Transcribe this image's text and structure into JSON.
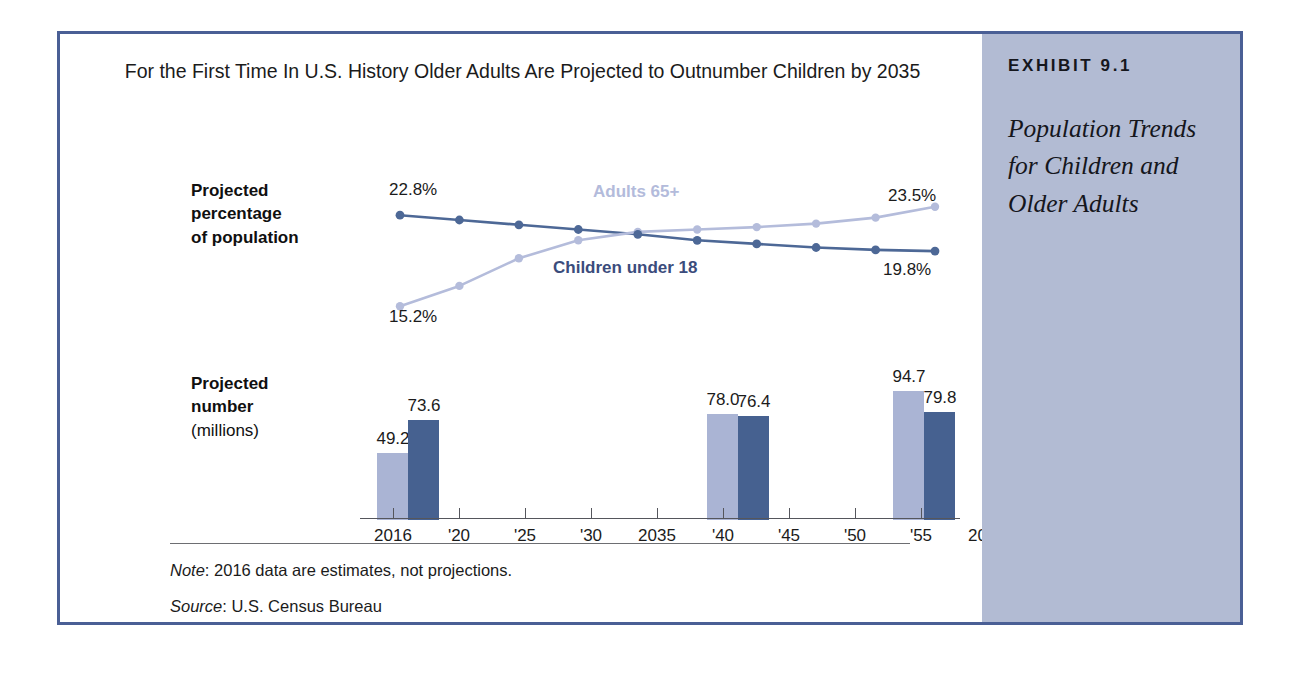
{
  "caption": {
    "exhibit_number": "EXHIBIT 9.1",
    "title": "Population Trends for Children and Older Adults"
  },
  "chart_title": "For the First Time In U.S. History Older Adults Are Projected to Outnumber Children by 2035",
  "labels": {
    "percent_axis_line1": "Projected",
    "percent_axis_line2": "percentage",
    "percent_axis_line3": "of population",
    "number_axis_line1": "Projected",
    "number_axis_line2": "number",
    "number_axis_line3": "(millions)"
  },
  "footnotes": {
    "note_prefix": "Note",
    "note_text": ": 2016 data are estimates, not projections.",
    "source_prefix": "Source",
    "source_text": ": U.S. Census Bureau"
  },
  "colors": {
    "frame": "#4a5f95",
    "caption_panel": "#b2bbd3",
    "older_adults": "#aab4d4",
    "children": "#466190",
    "older_adults_label": "#b3bbdb",
    "children_label": "#3b4c7c"
  },
  "chart_data": [
    {
      "type": "line",
      "title": "For the First Time In U.S. History Older Adults Are Projected to Outnumber Children by 2035",
      "ylabel": "Projected percentage of population",
      "xlabel": "",
      "grid": false,
      "legend": "inline-annotations",
      "x": [
        2016,
        2020,
        2025,
        2030,
        2035,
        2040,
        2045,
        2050,
        2055,
        2060
      ],
      "series": [
        {
          "name": "Children under 18",
          "color": "#466190",
          "values": [
            22.8,
            22.4,
            22.0,
            21.6,
            21.2,
            20.7,
            20.4,
            20.1,
            19.9,
            19.8
          ],
          "endpoint_labels": {
            "first": "22.8%",
            "last": "19.8%"
          }
        },
        {
          "name": "Adults 65+",
          "color": "#aab4d4",
          "values": [
            15.2,
            16.9,
            19.2,
            20.7,
            21.4,
            21.6,
            21.8,
            22.1,
            22.6,
            23.5
          ],
          "endpoint_labels": {
            "first": "15.2%",
            "last": "23.5%"
          }
        }
      ],
      "annotations": [
        {
          "text": "Adults 65+",
          "color": "#b3bbdb"
        },
        {
          "text": "Children under 18",
          "color": "#3b4c7c"
        }
      ]
    },
    {
      "type": "bar",
      "ylabel": "Projected number (millions)",
      "xlabel": "",
      "grid": false,
      "categories": [
        "2016",
        "'20",
        "'25",
        "'30",
        "2035",
        "'40",
        "'45",
        "'50",
        "'55",
        "2060"
      ],
      "series": [
        {
          "name": "Adults 65+",
          "color": "#aab4d4",
          "values": [
            49.2,
            null,
            null,
            null,
            78.0,
            null,
            null,
            null,
            null,
            94.7
          ]
        },
        {
          "name": "Children under 18",
          "color": "#466190",
          "values": [
            73.6,
            null,
            null,
            null,
            76.4,
            null,
            null,
            null,
            null,
            79.8
          ]
        }
      ],
      "bar_labels": [
        "49.2",
        "73.6",
        "78.0",
        "76.4",
        "94.7",
        "79.8"
      ],
      "ylim": [
        0,
        100
      ]
    }
  ],
  "bars": [
    {
      "label": "49.2",
      "value": 49.2,
      "tone": "light",
      "left": 17,
      "label_left": -7
    },
    {
      "label": "73.6",
      "value": 73.6,
      "tone": "dark",
      "left": 48,
      "label_left": 24
    },
    {
      "label": "78.0",
      "value": 78.0,
      "tone": "light",
      "left": 347,
      "label_left": 323
    },
    {
      "label": "76.4",
      "value": 76.4,
      "tone": "dark",
      "left": 378,
      "label_left": 354
    },
    {
      "label": "94.7",
      "value": 94.7,
      "tone": "light",
      "left": 533,
      "label_left": 509
    },
    {
      "label": "79.8",
      "value": 79.8,
      "tone": "dark",
      "left": 564,
      "label_left": 540
    }
  ],
  "x_ticks": [
    {
      "label": "2016",
      "pos": 33
    },
    {
      "label": "'20",
      "pos": 99
    },
    {
      "label": "'25",
      "pos": 165
    },
    {
      "label": "'30",
      "pos": 231
    },
    {
      "label": "2035",
      "pos": 297
    },
    {
      "label": "'40",
      "pos": 363
    },
    {
      "label": "'45",
      "pos": 429
    },
    {
      "label": "'50",
      "pos": 495
    },
    {
      "label": "'55",
      "pos": 561
    },
    {
      "label": "2060",
      "pos": 627
    }
  ],
  "percent_callouts": {
    "start_top": "22.8%",
    "end_top": "23.5%",
    "start_bottom": "15.2%",
    "end_bottom": "19.8%"
  },
  "series_labels": {
    "adults": "Adults 65+",
    "children": "Children under 18"
  }
}
